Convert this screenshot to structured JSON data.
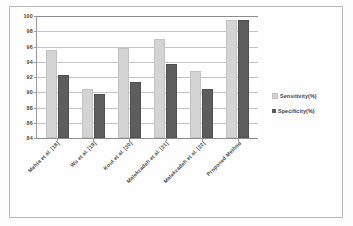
{
  "chart_data": {
    "type": "bar",
    "title": "",
    "xlabel": "",
    "ylabel": "",
    "ylim": [
      84,
      100
    ],
    "yticks": [
      84,
      86,
      88,
      90,
      92,
      94,
      96,
      98,
      100
    ],
    "grid": true,
    "legend_position": "right",
    "categories": [
      "Mehta et al. [18]",
      "Wu et al. [19]",
      "Kout et al. [20]",
      "Malekzadeh et al. [21]",
      "Malekzadeh et al. [22]",
      "Proposed Method"
    ],
    "series": [
      {
        "name": "Sensitivity(%)",
        "color": "#d4d4d4",
        "values": [
          95.3,
          90.2,
          95.5,
          96.7,
          92.5,
          99.2
        ]
      },
      {
        "name": "Specificity(%)",
        "color": "#5d5d5d",
        "values": [
          92.0,
          89.5,
          91.1,
          93.4,
          90.2,
          99.2
        ]
      }
    ]
  },
  "legend": {
    "items": [
      {
        "label": "Sensitivity(%)"
      },
      {
        "label": "Specificity(%)"
      }
    ]
  }
}
